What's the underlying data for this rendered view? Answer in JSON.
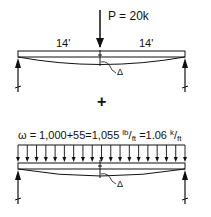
{
  "case1": {
    "load_label": "P = 20k",
    "span_left": "14'",
    "span_right": "14'",
    "deflection_symbol": "Δ"
  },
  "combine_symbol": "+",
  "case2": {
    "load_prefix": "ω = 1,000+55=1,055 ",
    "unit1_num": "lb",
    "unit1_den": "ft",
    "load_mid": " =1.06 ",
    "unit2_num": "k",
    "unit2_den": "ft",
    "deflection_symbol": "Δ",
    "arrow_count": 19
  },
  "colors": {
    "line": "#111111",
    "background": "#ffffff"
  }
}
